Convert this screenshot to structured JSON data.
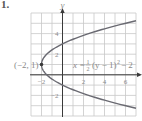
{
  "problem_number": "1.",
  "chart_data": {
    "type": "line",
    "title": "",
    "equation": "x = 1/2 (y − 1)^2 − 2",
    "equation_display": {
      "lhs": "x =",
      "frac_num": "1",
      "frac_den": "2",
      "rhs": "(y − 1)",
      "exponent": "2",
      "tail": "− 2"
    },
    "xlabel": "",
    "ylabel": "y",
    "xlim": [
      -3,
      7
    ],
    "ylim": [
      -4,
      6
    ],
    "grid": true,
    "x_tick_labels": [
      "−2",
      "2",
      "4",
      "6"
    ],
    "x_tick_values": [
      -2,
      2,
      4,
      6
    ],
    "y_tick_labels": [
      "4",
      "2",
      "−2"
    ],
    "y_tick_values": [
      4,
      2,
      -2
    ],
    "annotations": [
      {
        "text": "(−2, 1)",
        "x": -2,
        "y": 1,
        "type": "vertex-point"
      }
    ],
    "series": [
      {
        "name": "parabola",
        "points": [
          {
            "x": 7,
            "y": 5.24
          },
          {
            "x": 6,
            "y": 5
          },
          {
            "x": 2.5,
            "y": 4
          },
          {
            "x": 0,
            "y": 3
          },
          {
            "x": -1.5,
            "y": 2
          },
          {
            "x": -2,
            "y": 1
          },
          {
            "x": -1.5,
            "y": 0
          },
          {
            "x": 0,
            "y": -1
          },
          {
            "x": 2.5,
            "y": -2
          },
          {
            "x": 6,
            "y": -3
          },
          {
            "x": 7,
            "y": -3.24
          }
        ]
      }
    ]
  },
  "colors": {
    "grid": "#c8c8c8",
    "axis": "#3a3a3a",
    "curve": "#6a6a72",
    "text": "#8a8a8a"
  }
}
